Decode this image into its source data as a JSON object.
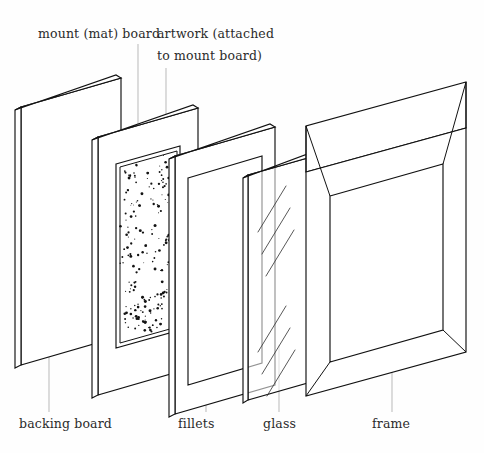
{
  "diagram": {
    "background_color": "#fefefe",
    "ink_color": "#111111",
    "leader_color": "#b9b9b9",
    "text_color": "#2b2b2b"
  },
  "labels": {
    "top": [
      {
        "id": "mount-board",
        "line1": "mount (mat) board",
        "x": 38,
        "y": 38
      },
      {
        "id": "artwork",
        "line1": "artwork (attached",
        "line2": "to mount board)",
        "x": 157,
        "y": 38,
        "y2": 60
      }
    ],
    "bottom": [
      {
        "id": "backing-board",
        "text": "backing board",
        "x": 19,
        "y": 428
      },
      {
        "id": "fillets",
        "text": "fillets",
        "x": 178,
        "y": 428
      },
      {
        "id": "glass",
        "text": "glass",
        "x": 263,
        "y": 428
      },
      {
        "id": "frame",
        "text": "frame",
        "x": 372,
        "y": 428
      }
    ]
  },
  "leader_lines": [
    {
      "id": "leader-mount-board",
      "x1": 138,
      "y1": 44,
      "x2": 138,
      "y2": 136
    },
    {
      "id": "leader-artwork",
      "x1": 166,
      "y1": 68,
      "x2": 166,
      "y2": 131
    },
    {
      "id": "leader-backing-board",
      "x1": 49,
      "y1": 300,
      "x2": 49,
      "y2": 412
    },
    {
      "id": "leader-fillets",
      "x1": 206,
      "y1": 345,
      "x2": 206,
      "y2": 412
    },
    {
      "id": "leader-glass",
      "x1": 279,
      "y1": 345,
      "x2": 279,
      "y2": 412
    },
    {
      "id": "leader-frame",
      "x1": 392,
      "y1": 350,
      "x2": 392,
      "y2": 412
    }
  ],
  "components": {
    "backing_board": {
      "name": "backing board",
      "face": "21,107 121,78 121,336 21,365",
      "thickness_edge": "21,107 15,110 15,368 21,365",
      "top_edge": "21,107 121,78 116,75 15,110"
    },
    "mount_board": {
      "name": "mount (mat) board",
      "face": "98,137 198,108 198,366 98,395",
      "thickness_edge": "98,137 92,140 92,398 98,395",
      "top_edge": "98,137 198,108 193,105 92,140",
      "aperture": "116,164 180,146 180,330 116,348",
      "aperture_inner": "120,167 177,151 177,327 120,343"
    },
    "fillets": {
      "name": "fillets",
      "outer": "175,156 275,127 275,385 175,414",
      "inner": "188,178 262,156 262,363 188,385",
      "thickness_edge": "175,156 169,159 169,417 175,414",
      "top_edge": "175,156 275,127 270,124 169,159"
    },
    "glass": {
      "name": "glass",
      "face": "248,175 318,155 318,380 248,400",
      "thickness_edge": "248,175 243,178 243,403 248,400",
      "top_edge": "248,175 318,155 313,152 243,178",
      "reflections": [
        {
          "x1": 258,
          "y1": 232,
          "x2": 286,
          "y2": 186
        },
        {
          "x1": 262,
          "y1": 254,
          "x2": 290,
          "y2": 208
        },
        {
          "x1": 266,
          "y1": 276,
          "x2": 294,
          "y2": 230
        },
        {
          "x1": 258,
          "y1": 352,
          "x2": 286,
          "y2": 306
        },
        {
          "x1": 262,
          "y1": 374,
          "x2": 290,
          "y2": 328
        },
        {
          "x1": 267,
          "y1": 396,
          "x2": 295,
          "y2": 350
        }
      ]
    },
    "frame": {
      "name": "frame",
      "outer_front": "306,172 466,128 466,352 306,396",
      "outer_top": "306,172 466,128 466,82 306,126",
      "top_bevel_outer": "306,126 466,82",
      "top_bevel_inner": "330,196 443,164",
      "opening": "330,196 443,164 443,330 330,362",
      "miter_lines": [
        {
          "x1": 306,
          "y1": 126,
          "x2": 330,
          "y2": 196
        },
        {
          "x1": 466,
          "y1": 82,
          "x2": 443,
          "y2": 164
        },
        {
          "x1": 306,
          "y1": 396,
          "x2": 330,
          "y2": 362
        },
        {
          "x1": 466,
          "y1": 352,
          "x2": 443,
          "y2": 330
        },
        {
          "x1": 466,
          "y1": 82,
          "x2": 466,
          "y2": 128
        },
        {
          "x1": 306,
          "y1": 126,
          "x2": 306,
          "y2": 172
        }
      ],
      "left_rail_outer": "306,172 306,396",
      "left_rail_inner": "330,196 330,362"
    }
  },
  "stipple": {
    "description": "artwork rendered as irregular ink stipple inside mount aperture",
    "dot_count": 196,
    "seed": 20240417
  }
}
